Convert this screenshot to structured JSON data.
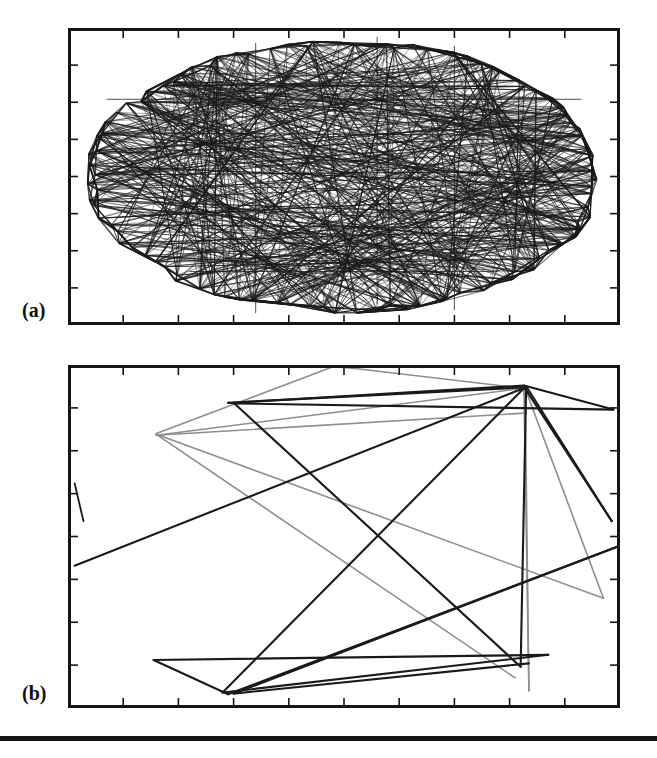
{
  "figure": {
    "kind": "scientific-figure",
    "background_color": "#ffffff",
    "ink_color": "#151515",
    "panels": [
      {
        "id": "a",
        "label": "(a)",
        "frame": {
          "x": 68,
          "y": 28,
          "width": 552,
          "height": 297
        },
        "border_width": 3,
        "ticks": {
          "top": 10,
          "bottom": 10,
          "left": 8,
          "right": 8,
          "length": 7,
          "direction": "inward"
        },
        "caption_hidden": "Dense chord trajectory filling an elliptical billiard region"
      },
      {
        "id": "b",
        "label": "(b)",
        "frame": {
          "x": 68,
          "y": 365,
          "width": 552,
          "height": 343
        },
        "border_width": 3,
        "ticks": {
          "top": 10,
          "bottom": 10,
          "left": 8,
          "right": 8,
          "length": 7,
          "direction": "inward"
        },
        "caption_hidden": "Sparse trajectory with a small number of long straight segments"
      }
    ],
    "bottom_rule": {
      "x": 0,
      "y": 736,
      "width": 657,
      "height": 5,
      "color": "#151515"
    }
  },
  "chart_data": [
    {
      "type": "line",
      "title": "(a)",
      "xlabel": "",
      "ylabel": "",
      "xlim": [
        0,
        1
      ],
      "ylim": [
        0,
        1
      ],
      "grid": false,
      "legend": "none",
      "description": "Dense set of straight chords densely filling an ellipse inscribed in the frame; trajectory of a chaotic/ergodic billiard in an elliptical-like boundary.",
      "boundary": {
        "shape": "ellipse",
        "cx": 0.5,
        "cy": 0.5,
        "rx": 0.465,
        "ry": 0.455
      },
      "segment_count": 520,
      "segments_note": "Chords connect pseudo-random points sampled on the ellipse boundary; plotted as thin dark lines.",
      "series": [
        {
          "name": "billiard-chords",
          "color": "#1a1a1a",
          "line_width": 0.8,
          "values": []
        }
      ]
    },
    {
      "type": "line",
      "title": "(b)",
      "xlabel": "",
      "ylabel": "",
      "xlim": [
        0,
        1
      ],
      "ylim": [
        0,
        1
      ],
      "grid": false,
      "legend": "none",
      "description": "Sparse polyline trajectory of about twenty long straight segments bouncing inside the rectangular frame; several segments converge at a hub near the upper right.",
      "segment_count": 22,
      "series": [
        {
          "name": "trajectory-dark",
          "color": "#1a1a1a",
          "line_width": 2.1,
          "points": [
            [
              0.012,
              0.585
            ],
            [
              0.83,
              0.065
            ],
            [
              0.29,
              0.11
            ],
            [
              0.305,
              0.112
            ],
            [
              0.988,
              0.13
            ],
            [
              0.826,
              0.06
            ],
            [
              0.3,
              0.11
            ],
            [
              0.82,
              0.88
            ],
            [
              0.83,
              0.062
            ],
            [
              0.985,
              0.455
            ],
            [
              0.827,
              0.066
            ],
            [
              0.28,
              0.955
            ],
            [
              0.87,
              0.845
            ],
            [
              0.155,
              0.86
            ],
            [
              0.29,
              0.96
            ],
            [
              0.995,
              0.53
            ],
            [
              0.3,
              0.958
            ],
            [
              0.835,
              0.87
            ]
          ]
        },
        {
          "name": "trajectory-light",
          "color": "#8e8e8e",
          "line_width": 1.6,
          "points": [
            [
              0.16,
              0.2
            ],
            [
              0.48,
              0.005
            ],
            [
              0.52,
              0.01
            ],
            [
              0.825,
              0.068
            ],
            [
              0.16,
              0.205
            ],
            [
              0.83,
              0.14
            ],
            [
              0.826,
              0.07
            ],
            [
              0.835,
              0.95
            ],
            [
              0.828,
              0.068
            ],
            [
              0.97,
              0.68
            ],
            [
              0.16,
              0.202
            ],
            [
              0.81,
              0.912
            ]
          ]
        }
      ]
    }
  ]
}
